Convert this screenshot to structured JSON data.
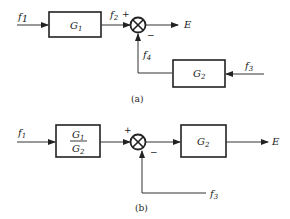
{
  "diagram_a": {
    "caption": "(a)",
    "input_f1": "f",
    "input_f1_sub": "1",
    "block_g1": "G",
    "block_g1_sub": "1",
    "signal_f2": "f",
    "signal_f2_sub": "2",
    "sum_plus": "+",
    "sum_minus": "−",
    "output": "E",
    "signal_f4": "f",
    "signal_f4_sub": "4",
    "block_g2": "G",
    "block_g2_sub": "2",
    "input_f3": "f",
    "input_f3_sub": "3"
  },
  "diagram_b": {
    "caption": "(b)",
    "input_f1": "f",
    "input_f1_sub": "1",
    "block_ratio_num": "G",
    "block_ratio_num_sub": "1",
    "block_ratio_den": "G",
    "block_ratio_den_sub": "2",
    "sum_plus": "+",
    "sum_minus": "−",
    "block_g2": "G",
    "block_g2_sub": "2",
    "output": "E",
    "input_f3": "f",
    "input_f3_sub": "3"
  }
}
